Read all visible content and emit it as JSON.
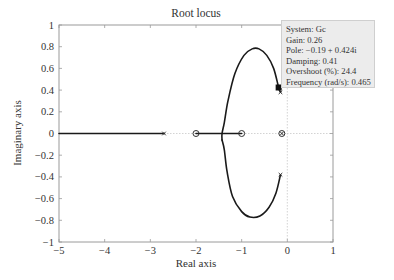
{
  "chart_data": {
    "type": "line",
    "title": "Root locus",
    "xlabel": "Real axis",
    "ylabel": "Imaginary axis",
    "xlim": [
      -5,
      1
    ],
    "ylim": [
      -1,
      1
    ],
    "xticks": [
      -5,
      -4,
      -3,
      -2,
      -1,
      0,
      1
    ],
    "yticks": [
      -1,
      -0.8,
      -0.6,
      -0.4,
      -0.2,
      0,
      0.2,
      0.4,
      0.6,
      0.8,
      1
    ],
    "xtick_labels": [
      "−5",
      "−4",
      "−3",
      "−2",
      "−1",
      "0",
      "1"
    ],
    "ytick_labels": [
      "−1",
      "−0.8",
      "−0.6",
      "−0.4",
      "−0.2",
      "0",
      "0.2",
      "0.4",
      "0.6",
      "0.8",
      "1"
    ],
    "grid": "dotted zero lines only",
    "poles": [
      {
        "re": -2.7,
        "im": 0
      },
      {
        "re": -0.12,
        "im": 0
      },
      {
        "re": -0.15,
        "im": 0.38
      },
      {
        "re": -0.15,
        "im": -0.38
      }
    ],
    "zeros": [
      {
        "re": -2.0,
        "im": 0
      },
      {
        "re": -1.0,
        "im": 0
      },
      {
        "re": -0.12,
        "im": 0
      }
    ],
    "series": [
      {
        "name": "real-axis branch (left)",
        "points": [
          [
            -5,
            0
          ],
          [
            -2.7,
            0
          ]
        ]
      },
      {
        "name": "real-axis branch (between zeros)",
        "points": [
          [
            -2.0,
            0
          ],
          [
            -1.0,
            0
          ]
        ]
      },
      {
        "name": "upper complex branch",
        "points": [
          [
            -0.15,
            0.38
          ],
          [
            -0.19,
            0.424
          ],
          [
            -0.3,
            0.6
          ],
          [
            -0.45,
            0.72
          ],
          [
            -0.62,
            0.78
          ],
          [
            -0.77,
            0.78
          ],
          [
            -0.95,
            0.72
          ],
          [
            -1.15,
            0.55
          ],
          [
            -1.3,
            0.3
          ],
          [
            -1.38,
            0.1
          ],
          [
            -1.43,
            0
          ],
          [
            -1.43,
            -0.06
          ]
        ]
      },
      {
        "name": "lower complex branch",
        "points": [
          [
            -0.15,
            -0.38
          ],
          [
            -0.25,
            -0.55
          ],
          [
            -0.4,
            -0.68
          ],
          [
            -0.6,
            -0.76
          ],
          [
            -0.82,
            -0.77
          ],
          [
            -1.0,
            -0.72
          ],
          [
            -1.2,
            -0.58
          ],
          [
            -1.32,
            -0.35
          ],
          [
            -1.38,
            -0.15
          ],
          [
            -1.43,
            -0.06
          ]
        ]
      }
    ],
    "selected_point": {
      "re": -0.19,
      "im": 0.424
    }
  },
  "tooltip": {
    "system": "System: Gc",
    "gain": "Gain: 0.26",
    "pole": "Pole: −0.19 + 0.424i",
    "damping": "Damping: 0.41",
    "overshoot": "Overshoot (%): 24.4",
    "frequency": "Frequency (rad/s): 0.465"
  },
  "colors": {
    "curve": "#1a1a1a",
    "frame": "#9a9a9a",
    "zero_line": "#c8c8c8",
    "tooltip_bg": "#ececec"
  }
}
